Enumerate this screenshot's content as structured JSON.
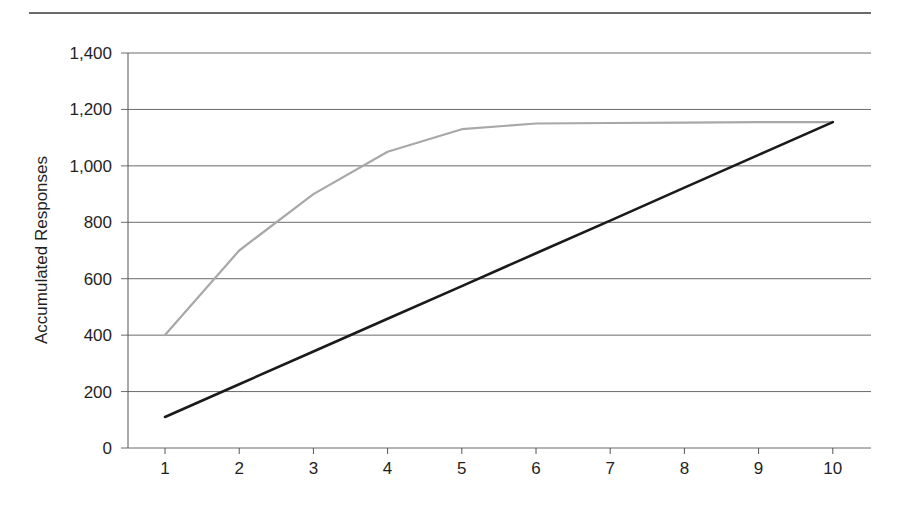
{
  "chart_data": {
    "type": "line",
    "title": "",
    "xlabel": "",
    "ylabel": "Accumulated Responses",
    "x": [
      1,
      2,
      3,
      4,
      5,
      6,
      7,
      8,
      9,
      10
    ],
    "x_tick_labels": [
      "1",
      "2",
      "3",
      "4",
      "5",
      "6",
      "7",
      "8",
      "9",
      "10"
    ],
    "y_tick_values": [
      0,
      200,
      400,
      600,
      800,
      1000,
      1200,
      1400
    ],
    "y_tick_labels": [
      "0",
      "200",
      "400",
      "600",
      "800",
      "1,000",
      "1,200",
      "1,400"
    ],
    "ylim": [
      0,
      1400
    ],
    "grid": "horizontal",
    "legend": "none",
    "series": [
      {
        "name": "gray-series",
        "color": "#a8a8a8",
        "values": [
          400,
          700,
          900,
          1050,
          1130,
          1150,
          1152,
          1153,
          1155,
          1155
        ]
      },
      {
        "name": "black-series",
        "color": "#1a1a1a",
        "values": [
          110,
          226,
          342,
          458,
          574,
          690,
          806,
          923,
          1039,
          1155
        ]
      }
    ]
  }
}
